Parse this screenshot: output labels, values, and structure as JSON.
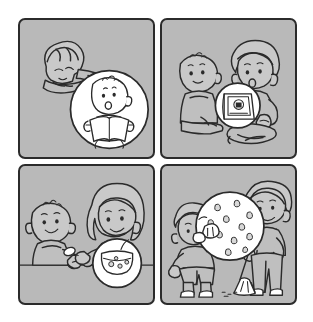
{
  "illustration": {
    "title": "Children's picture-story sequence",
    "layout": "2x2 comic panel grid",
    "panel_count": 4,
    "background_color": "#ffffff",
    "panel_fill_color": "#b9b9b9",
    "line_color": "#2b2b2b",
    "inset_fill_color": "#ffffff"
  },
  "panels": [
    {
      "id": "panel-1",
      "position": "top-left",
      "caption": "Boy lying down resting his head on his arms",
      "inset": {
        "shape": "circle",
        "caption": "Close-up of a baby holding an open book and reading aloud"
      },
      "characters": [
        "boy-lying-down",
        "baby-reading-book"
      ],
      "objects": [
        "open-book"
      ]
    },
    {
      "id": "panel-2",
      "position": "top-right",
      "caption": "Baby sitting on the floor beside a boy sitting cross-legged",
      "inset": {
        "shape": "circle",
        "caption": "Close-up of the picture book the boy is holding up"
      },
      "characters": [
        "baby-sitting",
        "boy-cross-legged"
      ],
      "objects": [
        "picture-book",
        "shoe"
      ]
    },
    {
      "id": "panel-3",
      "position": "bottom-left",
      "caption": "Woman with long wavy hair feeding a baby with a spoon at a table",
      "inset": {
        "shape": "circle",
        "caption": "Close-up of a bowl of food on the table"
      },
      "characters": [
        "baby-at-table",
        "woman-feeding"
      ],
      "objects": [
        "spoon",
        "food-bowl",
        "table-edge"
      ]
    },
    {
      "id": "panel-4",
      "position": "bottom-right",
      "caption": "Boy eating a cookie while a man sweeps the floor with a broom",
      "inset": {
        "shape": "circle",
        "caption": "Close-up of a chocolate chip cookie with crumbs"
      },
      "characters": [
        "boy-eating-cookie",
        "man-sweeping"
      ],
      "objects": [
        "cookie",
        "broom",
        "dust-pile"
      ]
    }
  ]
}
